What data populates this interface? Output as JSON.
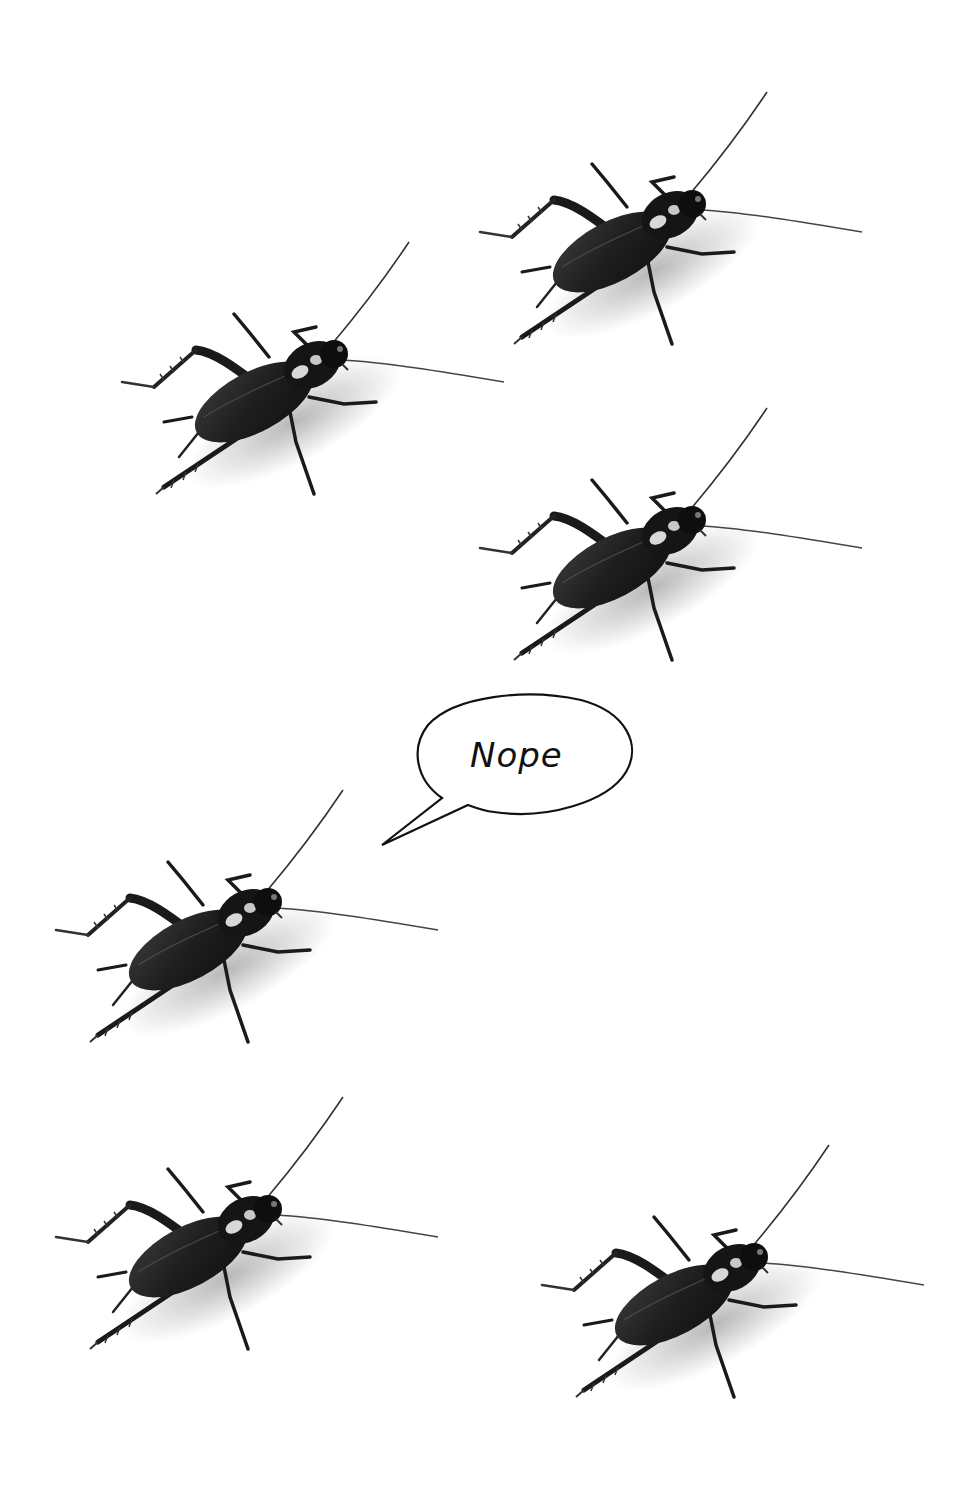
{
  "scene": {
    "background": "#ffffff",
    "subject": "cricket",
    "cricket_count": 6,
    "crickets": [
      {
        "id": "top-right",
        "x": 462,
        "y": 82
      },
      {
        "id": "upper-left",
        "x": 104,
        "y": 232
      },
      {
        "id": "middle-right",
        "x": 462,
        "y": 398
      },
      {
        "id": "speaker-left",
        "x": 38,
        "y": 780
      },
      {
        "id": "bottom-left",
        "x": 38,
        "y": 1087
      },
      {
        "id": "bottom-right",
        "x": 524,
        "y": 1135
      }
    ]
  },
  "speech_bubble": {
    "text": "Nope",
    "speaker": "speaker-left"
  }
}
